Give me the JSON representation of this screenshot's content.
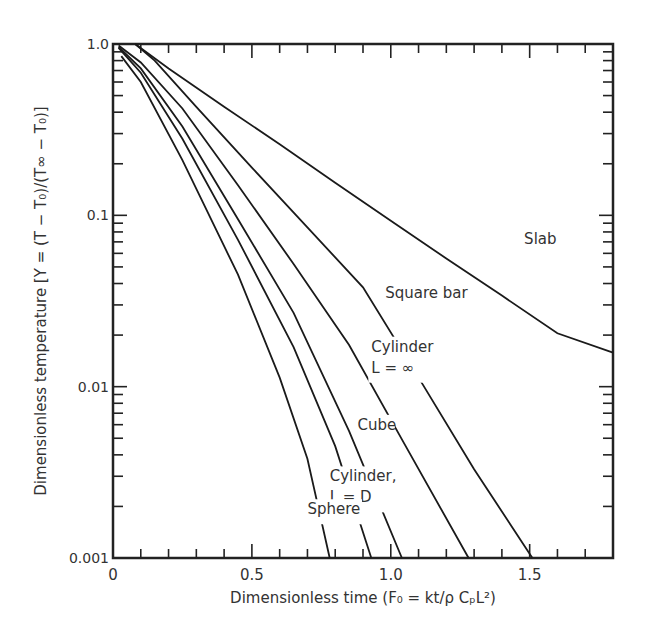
{
  "chart_data": {
    "type": "line",
    "title": "",
    "xlabel": "Dimensionless time (F₀ = kt/ρ CₚL²)",
    "ylabel": "Dimensionless temperature [Y = (T − T₀)/(T∞ − T₀)]",
    "xlim": [
      0,
      1.8
    ],
    "ylim": [
      0.001,
      1.0
    ],
    "yscale": "log",
    "x_ticks": [
      0,
      0.5,
      1.0,
      1.5
    ],
    "x_tick_labels": [
      "0",
      "0.5",
      "1.0",
      "1.5"
    ],
    "y_ticks": [
      1.0,
      0.1,
      0.01,
      0.001
    ],
    "y_tick_labels": [
      "1.0",
      "0.1",
      "0.01",
      "0.001"
    ],
    "grid": false,
    "legend": "inline labels",
    "series": [
      {
        "name": "Slab",
        "label_lines": [
          "Slab"
        ],
        "label_at": [
          1.48,
          0.068
        ],
        "points": [
          [
            0.08,
            1.0
          ],
          [
            0.2,
            0.72
          ],
          [
            0.4,
            0.43
          ],
          [
            0.6,
            0.26
          ],
          [
            0.8,
            0.155
          ],
          [
            1.0,
            0.093
          ],
          [
            1.2,
            0.056
          ],
          [
            1.4,
            0.034
          ],
          [
            1.6,
            0.0205
          ],
          [
            1.8,
            0.0158
          ]
        ]
      },
      {
        "name": "Square bar",
        "label_lines": [
          "Square bar"
        ],
        "label_at": [
          0.98,
          0.033
        ],
        "points": [
          [
            0.08,
            1.0
          ],
          [
            0.15,
            0.8
          ],
          [
            0.3,
            0.43
          ],
          [
            0.5,
            0.19
          ],
          [
            0.7,
            0.085
          ],
          [
            0.9,
            0.038
          ],
          [
            1.1,
            0.0113
          ],
          [
            1.3,
            0.0033
          ],
          [
            1.51,
            0.001
          ]
        ]
      },
      {
        "name": "Cylinder L = ∞",
        "label_lines": [
          "Cylinder",
          "L = ∞"
        ],
        "label_at": [
          0.93,
          0.016
        ],
        "points": [
          [
            0.02,
            0.98
          ],
          [
            0.1,
            0.78
          ],
          [
            0.25,
            0.42
          ],
          [
            0.45,
            0.15
          ],
          [
            0.65,
            0.052
          ],
          [
            0.85,
            0.0175
          ],
          [
            1.05,
            0.0046
          ],
          [
            1.28,
            0.001
          ]
        ]
      },
      {
        "name": "Cube",
        "label_lines": [
          "Cube"
        ],
        "label_at": [
          0.88,
          0.0056
        ],
        "points": [
          [
            0.02,
            0.96
          ],
          [
            0.1,
            0.72
          ],
          [
            0.25,
            0.33
          ],
          [
            0.45,
            0.095
          ],
          [
            0.65,
            0.027
          ],
          [
            0.85,
            0.0055
          ],
          [
            1.04,
            0.001
          ]
        ]
      },
      {
        "name": "Cylinder, L = D",
        "label_lines": [
          "Cylinder,",
          "L = D"
        ],
        "label_at": [
          0.78,
          0.0028
        ],
        "points": [
          [
            0.02,
            0.95
          ],
          [
            0.1,
            0.68
          ],
          [
            0.25,
            0.28
          ],
          [
            0.45,
            0.072
          ],
          [
            0.65,
            0.017
          ],
          [
            0.8,
            0.0045
          ],
          [
            0.93,
            0.001
          ]
        ]
      },
      {
        "name": "Sphere",
        "label_lines": [
          "Sphere"
        ],
        "label_at": [
          0.7,
          0.0018
        ],
        "points": [
          [
            0.03,
            0.85
          ],
          [
            0.1,
            0.6
          ],
          [
            0.25,
            0.21
          ],
          [
            0.45,
            0.045
          ],
          [
            0.6,
            0.0113
          ],
          [
            0.7,
            0.0038
          ],
          [
            0.78,
            0.001
          ]
        ]
      }
    ]
  }
}
